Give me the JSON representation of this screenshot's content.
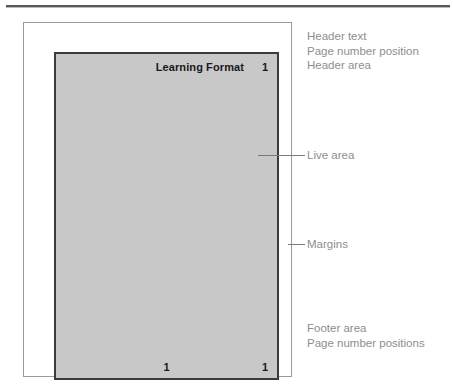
{
  "figure": {
    "page": {
      "header": {
        "title": "Learning Format",
        "page_number": "1"
      },
      "footer": {
        "page_number_center": "1",
        "page_number_right": "1"
      }
    },
    "annotations": {
      "header_block": [
        "Header text",
        "Page number position",
        "Header area"
      ],
      "live_area": "Live area",
      "margins": "Margins",
      "footer_block": [
        "Footer area",
        "Page number positions"
      ]
    },
    "colors": {
      "live_area_fill": "#c8c8c8",
      "live_area_border": "#3b3b3b",
      "page_frame_border": "#9a9a9a",
      "annotation_text": "#8e8e8e",
      "leader_line": "#7a7a7a",
      "rule": "#585858",
      "body_text": "#1a1a1a"
    }
  }
}
